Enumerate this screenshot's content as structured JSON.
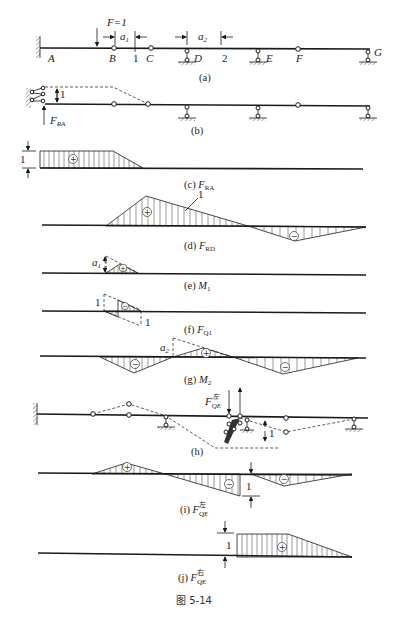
{
  "figure": {
    "caption": "图 5-14",
    "beam_labels": {
      "A": "A",
      "B": "B",
      "C": "C",
      "D": "D",
      "E": "E",
      "F": "F",
      "G": "G",
      "section1": "1",
      "section2": "2",
      "load": "F=1",
      "a1": "a",
      "a1_sub": "1",
      "a2": "a",
      "a2_sub": "2"
    },
    "panels": [
      {
        "id": "a",
        "caption": "(a)"
      },
      {
        "id": "b",
        "caption": "(b)",
        "reaction_label": "F",
        "reaction_sub": "RA",
        "unit": "1"
      },
      {
        "id": "c",
        "caption_prefix": "(c) ",
        "quantity": "F",
        "quantity_sub": "RA",
        "unit": "1",
        "sign": "+"
      },
      {
        "id": "d",
        "caption_prefix": "(d) ",
        "quantity": "F",
        "quantity_sub": "RD",
        "unit": "1",
        "signs": [
          "+",
          "−"
        ]
      },
      {
        "id": "e",
        "caption_prefix": "(e) ",
        "quantity": "M",
        "quantity_sub": "1",
        "height_label": "a",
        "height_sub": "1",
        "sign": "+"
      },
      {
        "id": "f",
        "caption_prefix": "(f) ",
        "quantity": "F",
        "quantity_sub": "Q1",
        "unit_left": "1",
        "unit_right": "1",
        "signs": [
          "−",
          "+"
        ]
      },
      {
        "id": "g",
        "caption_prefix": "(g) ",
        "quantity": "M",
        "quantity_sub": "2",
        "height_label": "a",
        "height_sub": "2",
        "signs": [
          "−",
          "+",
          "−"
        ]
      },
      {
        "id": "h",
        "caption": "(h)",
        "force_label": "F",
        "force_sup": "左",
        "force_sub": "QE",
        "unit": "1"
      },
      {
        "id": "i",
        "caption_prefix": "(i) ",
        "quantity": "F",
        "quantity_sup": "左",
        "quantity_sub": "QE",
        "unit": "1",
        "signs": [
          "+",
          "−",
          "−"
        ]
      },
      {
        "id": "j",
        "caption_prefix": "(j) ",
        "quantity": "F",
        "quantity_sup": "右",
        "quantity_sub": "QE",
        "unit": "1",
        "sign": "+"
      }
    ]
  }
}
